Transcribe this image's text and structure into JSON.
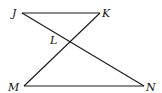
{
  "diagram": {
    "type": "geometry",
    "points": [
      {
        "name": "J",
        "label": "J",
        "x": 22,
        "y": 13,
        "label_x": 12,
        "label_y": 17
      },
      {
        "name": "K",
        "label": "K",
        "x": 100,
        "y": 13,
        "label_x": 102,
        "label_y": 17
      },
      {
        "name": "L",
        "label": "L",
        "x": 70,
        "y": 42,
        "label_x": 50,
        "label_y": 44
      },
      {
        "name": "M",
        "label": "M",
        "x": 24,
        "y": 86,
        "label_x": 9,
        "label_y": 91
      },
      {
        "name": "N",
        "label": "N",
        "x": 144,
        "y": 86,
        "label_x": 146,
        "label_y": 91
      }
    ],
    "segments": [
      {
        "name": "JK",
        "from": "J",
        "to": "K"
      },
      {
        "name": "MN",
        "from": "M",
        "to": "N"
      },
      {
        "name": "JN",
        "from": "J",
        "to": "N"
      },
      {
        "name": "KM",
        "from": "K",
        "to": "M"
      }
    ],
    "stroke_color": "#1a1a1a"
  }
}
